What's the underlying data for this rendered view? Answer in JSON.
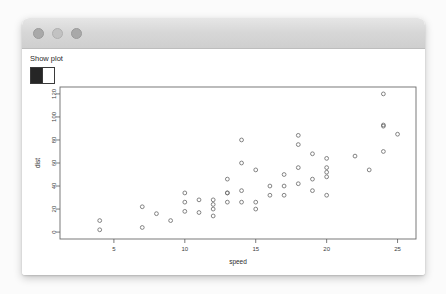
{
  "window": {
    "traffic_lights": [
      "close-button",
      "minimize-button",
      "maximize-button"
    ],
    "title": ""
  },
  "controls": {
    "checkbox_label": "Show plot",
    "checkbox_checked": true
  },
  "chart_data": {
    "type": "scatter",
    "title": "",
    "xlabel": "speed",
    "ylabel": "dist",
    "xlim": [
      1.2,
      26.3
    ],
    "ylim": [
      -6,
      126
    ],
    "xticks": [
      5,
      10,
      15,
      20,
      25
    ],
    "yticks": [
      0,
      20,
      40,
      60,
      80,
      100,
      120
    ],
    "grid": false,
    "legend": null,
    "marker": "open-circle",
    "x": [
      4,
      4,
      7,
      7,
      8,
      9,
      10,
      10,
      10,
      11,
      11,
      12,
      12,
      12,
      12,
      13,
      13,
      13,
      13,
      14,
      14,
      14,
      14,
      15,
      15,
      15,
      16,
      16,
      17,
      17,
      17,
      18,
      18,
      18,
      18,
      19,
      19,
      19,
      20,
      20,
      20,
      20,
      20,
      22,
      23,
      24,
      24,
      24,
      24,
      25
    ],
    "y": [
      2,
      10,
      4,
      22,
      16,
      10,
      18,
      26,
      34,
      17,
      28,
      14,
      20,
      24,
      28,
      26,
      34,
      34,
      46,
      26,
      36,
      60,
      80,
      20,
      26,
      54,
      32,
      40,
      32,
      40,
      50,
      42,
      56,
      76,
      84,
      36,
      46,
      68,
      32,
      48,
      52,
      56,
      64,
      66,
      54,
      70,
      92,
      93,
      120,
      85
    ]
  }
}
